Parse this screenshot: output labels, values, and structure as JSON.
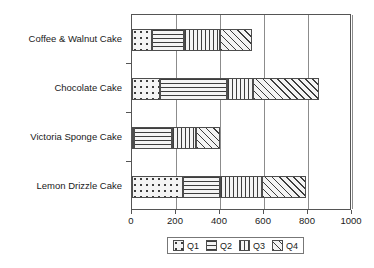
{
  "chart_data": {
    "type": "bar",
    "orientation": "horizontal",
    "stacked": true,
    "title": "",
    "xlabel": "",
    "ylabel": "",
    "xlim": [
      0,
      1000
    ],
    "xticks": [
      0,
      200,
      400,
      600,
      800,
      1000
    ],
    "xticklabels": [
      "0",
      "200",
      "400",
      "600",
      "800",
      "1000"
    ],
    "grid": true,
    "grid_axis": "x",
    "legend_position": "bottom-center",
    "categories": [
      "Coffee & Walnut Cake",
      "Chocolate Cake",
      "Victoria Sponge Cake",
      "Lemon Drizzle Cake"
    ],
    "series": [
      {
        "name": "Q1",
        "values": [
          90,
          125,
          10,
          230
        ]
      },
      {
        "name": "Q2",
        "values": [
          145,
          305,
          170,
          170
        ]
      },
      {
        "name": "Q3",
        "values": [
          165,
          120,
          110,
          190
        ]
      },
      {
        "name": "Q4",
        "values": [
          145,
          300,
          110,
          200
        ]
      }
    ],
    "totals": [
      545,
      850,
      400,
      790
    ]
  },
  "legend": {
    "entries": [
      {
        "label": "Q1",
        "pattern": "dots"
      },
      {
        "label": "Q2",
        "pattern": "horizontal-lines"
      },
      {
        "label": "Q3",
        "pattern": "vertical-lines"
      },
      {
        "label": "Q4",
        "pattern": "diagonal-lines"
      }
    ]
  },
  "colors": {
    "axis": "#555555",
    "gridline": "#8c8c8c",
    "bar_edge": "#4d4d4d",
    "bar_fill": "#f2f2f2",
    "hatch": "#3d3d3d",
    "text": "#1a1a1a",
    "background": "#ffffff"
  }
}
